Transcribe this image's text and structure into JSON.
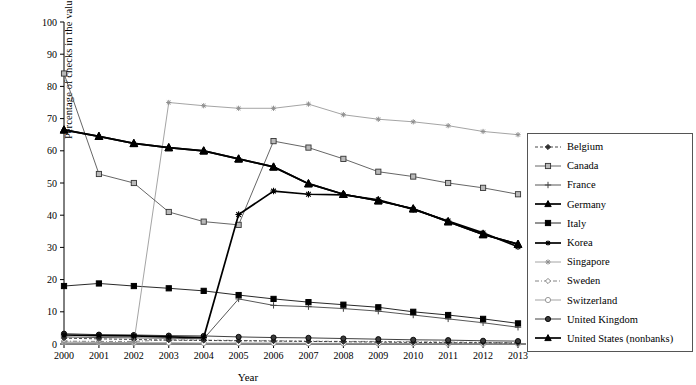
{
  "chart_data": {
    "type": "line",
    "title": "",
    "xlabel": "Year",
    "ylabel": "Percentage of checks in the value of cashless transactions",
    "x": [
      2000,
      2001,
      2002,
      2003,
      2004,
      2005,
      2006,
      2007,
      2008,
      2009,
      2010,
      2011,
      2012,
      2013
    ],
    "xlim": [
      2000,
      2013
    ],
    "ylim": [
      0,
      100
    ],
    "yticks": [
      0,
      10,
      20,
      30,
      40,
      50,
      60,
      70,
      80,
      90,
      100
    ],
    "xticks": [
      "2000",
      "2001",
      "2002",
      "2003",
      "2004",
      "2005",
      "2006",
      "2007",
      "2008",
      "2009",
      "2010",
      "2011",
      "2012",
      "2013"
    ],
    "grid": false,
    "legend_position": "right",
    "series": [
      {
        "name": "Belgium",
        "marker": "diamond",
        "line_style": "dashed",
        "color": "#333333",
        "values": [
          1.8,
          1.6,
          1.4,
          1.2,
          1.1,
          1.0,
          0.9,
          0.8,
          0.7,
          0.6,
          0.5,
          0.4,
          0.4,
          0.3
        ]
      },
      {
        "name": "Canada",
        "marker": "open-square",
        "line_style": "solid",
        "color": "#555555",
        "values": [
          84.0,
          52.8,
          50.0,
          41.0,
          38.0,
          37.0,
          63.0,
          61.0,
          57.5,
          53.5,
          52.0,
          50.0,
          48.5,
          46.5
        ]
      },
      {
        "name": "France",
        "marker": "plus",
        "line_style": "solid",
        "color": "#444444",
        "values": [
          2.2,
          2.0,
          1.9,
          1.8,
          1.6,
          14.0,
          12.0,
          11.6,
          11.0,
          10.2,
          9.0,
          7.8,
          6.6,
          5.2
        ]
      },
      {
        "name": "Germany",
        "marker": "filled-triangle",
        "line_style": "solid",
        "color": "#000000",
        "values": [
          66.5,
          64.5,
          62.3,
          61.0,
          60.0,
          57.5,
          55.0,
          49.8,
          46.5,
          44.5,
          42.0,
          38.0,
          34.0,
          31.0
        ]
      },
      {
        "name": "Italy",
        "marker": "filled-square",
        "line_style": "solid",
        "color": "#111111",
        "values": [
          18.0,
          18.8,
          18.0,
          17.3,
          16.5,
          15.2,
          14.0,
          13.0,
          12.2,
          11.4,
          10.0,
          9.0,
          7.8,
          6.4
        ]
      },
      {
        "name": "Korea",
        "marker": "asterisk",
        "line_style": "solid",
        "color": "#000000",
        "values": [
          2.8,
          2.6,
          2.5,
          2.2,
          2.0,
          40.2,
          47.5,
          46.5,
          46.3,
          44.8,
          41.8,
          38.2,
          34.5,
          30.2
        ]
      },
      {
        "name": "Singapore",
        "marker": "light-asterisk",
        "line_style": "solid",
        "color": "#9a9a9a",
        "values": [
          0.3,
          0.3,
          0.4,
          75.0,
          74.0,
          73.2,
          73.2,
          74.5,
          71.2,
          69.8,
          69.0,
          67.8,
          66.0,
          65.0
        ]
      },
      {
        "name": "Sweden",
        "marker": "open-diamond",
        "line_style": "dash-dot",
        "color": "#777777",
        "values": [
          0.9,
          0.8,
          0.8,
          1.3,
          1.2,
          1.1,
          1.0,
          0.9,
          0.8,
          0.8,
          0.7,
          0.6,
          0.5,
          0.4
        ]
      },
      {
        "name": "Switzerland",
        "marker": "open-circle",
        "line_style": "solid",
        "color": "#999999",
        "values": [
          0.6,
          0.5,
          0.4,
          0.4,
          0.3,
          0.3,
          0.3,
          0.2,
          0.2,
          0.2,
          0.2,
          0.1,
          0.1,
          0.1
        ]
      },
      {
        "name": "United Kingdom",
        "marker": "filled-circle",
        "line_style": "solid",
        "color": "#2b2b2b",
        "values": [
          3.2,
          2.9,
          2.8,
          2.6,
          2.5,
          2.2,
          2.0,
          1.9,
          1.7,
          1.5,
          1.3,
          1.2,
          1.0,
          0.9
        ]
      },
      {
        "name": "United States (nonbanks)",
        "marker": "filled-triangle",
        "line_style": "solid",
        "color": "#000000",
        "values": [
          66.5,
          64.5,
          62.3,
          61.0,
          60.0,
          57.5,
          55.0,
          49.8,
          46.5,
          44.5,
          42.0,
          38.0,
          34.0,
          31.0
        ]
      }
    ]
  },
  "legend": {
    "items": [
      {
        "label": "Belgium"
      },
      {
        "label": "Canada"
      },
      {
        "label": "France"
      },
      {
        "label": "Germany"
      },
      {
        "label": "Italy"
      },
      {
        "label": "Korea"
      },
      {
        "label": "Singapore"
      },
      {
        "label": "Sweden"
      },
      {
        "label": "Switzerland"
      },
      {
        "label": "United Kingdom"
      },
      {
        "label": "United States (nonbanks)"
      }
    ]
  }
}
